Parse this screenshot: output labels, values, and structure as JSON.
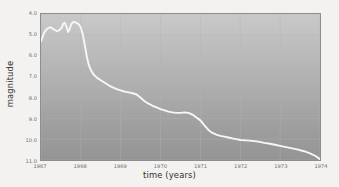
{
  "chart_data": {
    "type": "line",
    "title": "",
    "xlabel": "time (years)",
    "ylabel": "magnitude",
    "xlim": [
      1967,
      1974
    ],
    "ylim": [
      11.0,
      4.0
    ],
    "y_inverted": true,
    "grid": true,
    "legend": "none",
    "xticks": [
      1967,
      1968,
      1969,
      1970,
      1971,
      1972,
      1973,
      1974
    ],
    "xtick_labels": [
      "1967",
      "1968",
      "1969",
      "1970",
      "1971",
      "1972",
      "1973",
      "1974"
    ],
    "yticks": [
      4.0,
      5.0,
      6.0,
      7.0,
      8.0,
      9.0,
      10.0,
      11.0
    ],
    "ytick_labels": [
      "4.0",
      "5.0",
      "6.0",
      "7.0",
      "8.0",
      "9.0",
      "10.0",
      "11.0"
    ],
    "series": [
      {
        "name": "light curve",
        "color": "#f7f7f4",
        "x": [
          1967.0,
          1967.04,
          1967.08,
          1967.12,
          1967.16,
          1967.2,
          1967.24,
          1967.28,
          1967.32,
          1967.36,
          1967.4,
          1967.44,
          1967.48,
          1967.52,
          1967.56,
          1967.6,
          1967.64,
          1967.68,
          1967.72,
          1967.76,
          1967.8,
          1967.84,
          1967.88,
          1967.92,
          1967.96,
          1968.0,
          1968.05,
          1968.1,
          1968.15,
          1968.2,
          1968.26,
          1968.32,
          1968.4,
          1968.5,
          1968.6,
          1968.7,
          1968.8,
          1968.9,
          1969.0,
          1969.1,
          1969.2,
          1969.3,
          1969.4,
          1969.5,
          1969.6,
          1969.7,
          1969.8,
          1969.9,
          1970.0,
          1970.1,
          1970.2,
          1970.3,
          1970.4,
          1970.5,
          1970.6,
          1970.7,
          1970.8,
          1970.9,
          1971.0,
          1971.1,
          1971.2,
          1971.3,
          1971.4,
          1971.5,
          1971.6,
          1971.7,
          1971.8,
          1971.9,
          1972.0,
          1972.15,
          1972.3,
          1972.45,
          1972.6,
          1972.75,
          1972.9,
          1973.0,
          1973.15,
          1973.3,
          1973.45,
          1973.6,
          1973.75,
          1973.9,
          1974.0
        ],
        "y": [
          5.32,
          5.1,
          4.9,
          4.78,
          4.7,
          4.66,
          4.64,
          4.68,
          4.74,
          4.78,
          4.82,
          4.8,
          4.74,
          4.66,
          4.46,
          4.42,
          4.62,
          4.86,
          4.72,
          4.48,
          4.4,
          4.38,
          4.42,
          4.46,
          4.52,
          4.66,
          5.0,
          5.5,
          6.05,
          6.45,
          6.72,
          6.9,
          7.05,
          7.18,
          7.3,
          7.42,
          7.52,
          7.6,
          7.66,
          7.72,
          7.76,
          7.8,
          7.86,
          8.02,
          8.18,
          8.3,
          8.4,
          8.48,
          8.56,
          8.62,
          8.68,
          8.72,
          8.74,
          8.74,
          8.72,
          8.74,
          8.82,
          8.96,
          9.1,
          9.34,
          9.56,
          9.7,
          9.78,
          9.84,
          9.88,
          9.92,
          9.96,
          10.0,
          10.04,
          10.06,
          10.08,
          10.12,
          10.18,
          10.22,
          10.28,
          10.32,
          10.38,
          10.44,
          10.5,
          10.58,
          10.68,
          10.82,
          10.96
        ]
      }
    ]
  },
  "axis_titles": {
    "x": "time (years)",
    "y": "magnitude"
  }
}
